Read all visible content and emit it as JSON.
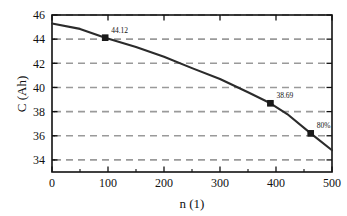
{
  "chart_data": {
    "type": "line",
    "title": "",
    "xlabel": "n (1)",
    "ylabel": "C (Ah)",
    "xlim": [
      0,
      500
    ],
    "ylim": [
      33,
      46
    ],
    "xticks": [
      "0",
      "100",
      "200",
      "300",
      "400",
      "500"
    ],
    "xtick_values": [
      0,
      100,
      200,
      300,
      400,
      500
    ],
    "yticks": [
      "34",
      "36",
      "38",
      "40",
      "42",
      "44",
      "46"
    ],
    "ytick_values": [
      34,
      36,
      38,
      40,
      42,
      44,
      46
    ],
    "grid": "horizontal-dashed",
    "grid_color": "#999999",
    "legend": "none",
    "line_color": "#2b2b2b",
    "marker_color": "#1a1a1a",
    "marker_style": "square",
    "x": [
      0,
      50,
      95,
      150,
      200,
      250,
      300,
      350,
      390,
      420,
      462,
      500
    ],
    "y": [
      45.3,
      44.85,
      44.12,
      43.35,
      42.55,
      41.6,
      40.7,
      39.6,
      38.69,
      37.8,
      36.2,
      34.8
    ],
    "annotations": [
      {
        "label": "44.12",
        "x": 95,
        "y": 44.12
      },
      {
        "label": "38.69",
        "x": 390,
        "y": 38.69
      },
      {
        "label": "80%",
        "x": 462,
        "y": 36.2
      }
    ],
    "markers": [
      {
        "x": 95,
        "y": 44.12
      },
      {
        "x": 390,
        "y": 38.69
      },
      {
        "x": 462,
        "y": 36.2
      }
    ]
  },
  "plot_frame": {
    "left": 52,
    "right": 332,
    "top": 15,
    "bottom": 172
  }
}
